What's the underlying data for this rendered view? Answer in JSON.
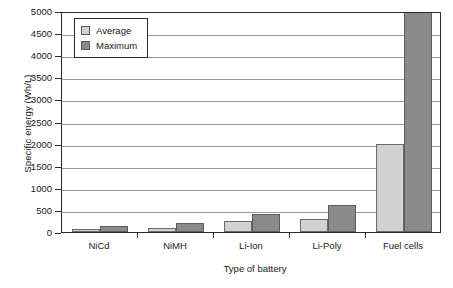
{
  "chart_data": {
    "type": "bar",
    "title": "",
    "subtitle": "",
    "xlabel": "Type of battery",
    "ylabel": "Specific energy (Wh/L)",
    "categories": [
      "NiCd",
      "NiMH",
      "Li-Ion",
      "Li-Poly",
      "Fuel cells"
    ],
    "series": [
      {
        "name": "Average",
        "color": "#d2d2d2",
        "values": [
          70,
          100,
          250,
          300,
          2000
        ]
      },
      {
        "name": "Maximum",
        "color": "#8a8a8a",
        "values": [
          130,
          200,
          400,
          600,
          5000
        ]
      }
    ],
    "ylim": [
      0,
      5000
    ],
    "ytick_step": 500,
    "yticks": [
      0,
      500,
      1000,
      1500,
      2000,
      2500,
      3000,
      3500,
      4000,
      4500,
      5000
    ],
    "ytick_labels": [
      "0",
      "500",
      "1000",
      "1500",
      "2000",
      "2500",
      "3000",
      "3500",
      "4000",
      "4500",
      "5000"
    ],
    "grid": "horizontal",
    "legend_position": "top-left-inside"
  },
  "legend": {
    "entries": [
      {
        "label": "Average"
      },
      {
        "label": "Maximum"
      }
    ]
  },
  "axes": {
    "y_title": "Specific energy (Wh/L)",
    "x_title": "Type of battery"
  }
}
